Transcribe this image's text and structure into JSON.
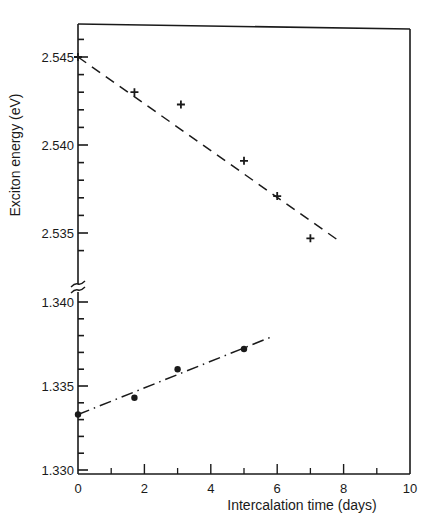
{
  "chart_data": {
    "type": "scatter",
    "title": "",
    "xlabel": "Intercalation time (days)",
    "ylabel": "Exciton energy (eV)",
    "xlim": [
      0,
      10
    ],
    "x_ticks": [
      0,
      2,
      4,
      6,
      8,
      10
    ],
    "x_minor_ticks": [
      1,
      3,
      5,
      7,
      9
    ],
    "broken_y_axis": true,
    "panels": [
      {
        "name": "upper",
        "ylim": [
          2.5335,
          2.547
        ],
        "y_ticks": [
          2.535,
          2.54,
          2.545
        ],
        "y_tick_labels": [
          "2.535",
          "2.540",
          "2.545"
        ],
        "y_minor_step": 0.001
      },
      {
        "name": "lower",
        "ylim": [
          1.33,
          1.3409
        ],
        "y_ticks": [
          1.33,
          1.335,
          1.34
        ],
        "y_tick_labels": [
          "1.330",
          "1.335",
          "1.340"
        ],
        "y_minor_step": 0.001
      }
    ],
    "series": [
      {
        "name": "upper exciton (+ markers)",
        "panel": "upper",
        "marker": "plus",
        "x": [
          0,
          1.7,
          3.1,
          5.0,
          6.0,
          7.0
        ],
        "y": [
          2.545,
          2.543,
          2.5423,
          2.5391,
          2.5371,
          2.5347
        ],
        "fit_line": {
          "style": "dashed",
          "x": [
            0,
            7.9
          ],
          "y": [
            2.545,
            2.5345
          ]
        }
      },
      {
        "name": "lower exciton (● markers)",
        "panel": "lower",
        "marker": "dot",
        "x": [
          0,
          1.7,
          3.0,
          5.0
        ],
        "y": [
          1.3333,
          1.3343,
          1.336,
          1.3372
        ],
        "fit_line": {
          "style": "dash-dot",
          "x": [
            0,
            5.8
          ],
          "y": [
            1.3333,
            1.3379
          ]
        }
      }
    ],
    "grid": false,
    "legend": null
  }
}
